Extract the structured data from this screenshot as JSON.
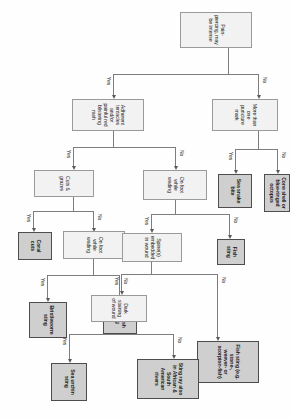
{
  "diagram": {
    "type": "decision-flowchart",
    "orientation": "rotated-90-clockwise",
    "colors": {
      "question_fill": "#f2f2f2",
      "outcome_fill": "#cfcfcf",
      "outcome_border": "#4d4d4d",
      "line": "#7d7d7d",
      "background": "#fefefe"
    },
    "edge_labels": {
      "yes": "Yes",
      "no": "No"
    },
    "nodes": [
      {
        "id": "q_pain",
        "kind": "question",
        "label": "Pain-piercing, may be intense"
      },
      {
        "id": "q_puncture",
        "kind": "question",
        "label": "More than one puncture mark"
      },
      {
        "id": "o_seasnake",
        "kind": "outcome",
        "label": "Sea snake bite"
      },
      {
        "id": "o_coneshell",
        "kind": "outcome",
        "label": "Cone shell or blue-ringed octopus"
      },
      {
        "id": "q_tentacles",
        "kind": "question",
        "label": "Adherent tentacles and/or painful red blistering rash"
      },
      {
        "id": "q_foot1",
        "kind": "question",
        "label": "On foot while wading"
      },
      {
        "id": "o_bristle",
        "kind": "outcome",
        "label": "Bristleworm sting"
      },
      {
        "id": "o_jellyfish",
        "kind": "outcome",
        "label": "Jellyfish sting"
      },
      {
        "id": "q_cuts",
        "kind": "question",
        "label": "Cuts & grazes"
      },
      {
        "id": "o_coralcuts",
        "kind": "outcome",
        "label": "Coral cuts"
      },
      {
        "id": "q_foot2",
        "kind": "question",
        "label": "On foot while wading"
      },
      {
        "id": "q_spines",
        "kind": "question",
        "label": "Spine(s) embedded in wound"
      },
      {
        "id": "q_dark",
        "kind": "question",
        "label": "Dark staining of wound"
      },
      {
        "id": "o_urchin",
        "kind": "outcome",
        "label": "Sea urchin sting"
      },
      {
        "id": "o_fishsting",
        "kind": "outcome",
        "label": "Fish sting"
      },
      {
        "id": "o_fishsting2",
        "kind": "outcome",
        "label": "Fish sting (e.g. stone-, weever- or scorpion-fish)"
      },
      {
        "id": "o_stingray",
        "kind": "outcome",
        "label": "Sting ray also in African & South American rivers"
      }
    ],
    "edges": [
      {
        "from": "q_pain",
        "to": "q_tentacles",
        "label": "Yes"
      },
      {
        "from": "q_pain",
        "to": "q_puncture",
        "label": "No"
      },
      {
        "from": "q_puncture",
        "to": "o_seasnake",
        "label": "Yes"
      },
      {
        "from": "q_puncture",
        "to": "o_coneshell",
        "label": "No"
      },
      {
        "from": "q_tentacles",
        "to": "q_cuts",
        "label": "Yes"
      },
      {
        "from": "q_tentacles",
        "to": "q_foot2",
        "label": "No"
      },
      {
        "from": "q_cuts",
        "to": "o_coralcuts",
        "label": "Yes"
      },
      {
        "from": "q_cuts",
        "to": "q_foot1",
        "label": "No"
      },
      {
        "from": "q_foot1",
        "to": "o_bristle",
        "label": "Yes"
      },
      {
        "from": "q_foot1",
        "to": "o_jellyfish",
        "label": "No"
      },
      {
        "from": "q_foot2",
        "to": "q_spines",
        "label": "Yes"
      },
      {
        "from": "q_foot2",
        "to": "o_fishsting",
        "label": "No"
      },
      {
        "from": "q_spines",
        "to": "q_dark",
        "label": "Yes"
      },
      {
        "from": "q_spines",
        "to": "o_fishsting2",
        "label": "No"
      },
      {
        "from": "q_dark",
        "to": "o_urchin",
        "label": "Yes"
      },
      {
        "from": "q_dark",
        "to": "o_stingray",
        "label": "No"
      }
    ]
  }
}
